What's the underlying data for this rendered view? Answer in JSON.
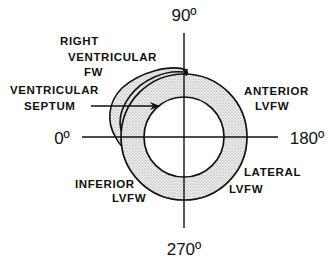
{
  "diagram": {
    "axis_labels": {
      "top": "90º",
      "left": "0º",
      "right": "180º",
      "bottom": "270º"
    },
    "regions": {
      "right_ventricular_fw": [
        "RIGHT",
        "VENTRICULAR",
        "FW"
      ],
      "ventricular_septum": [
        "VENTRICULAR",
        "SEPTUM"
      ],
      "anterior_lvfw": [
        "ANTERIOR",
        "LVFW"
      ],
      "inferior_lvfw": [
        "INFERIOR",
        "LVFW"
      ],
      "lateral_lvfw": [
        "LATERAL",
        "LVFW"
      ]
    },
    "colors": {
      "ink": "#111111",
      "stipple": "#d6d6d6",
      "background": "#ffffff"
    }
  }
}
